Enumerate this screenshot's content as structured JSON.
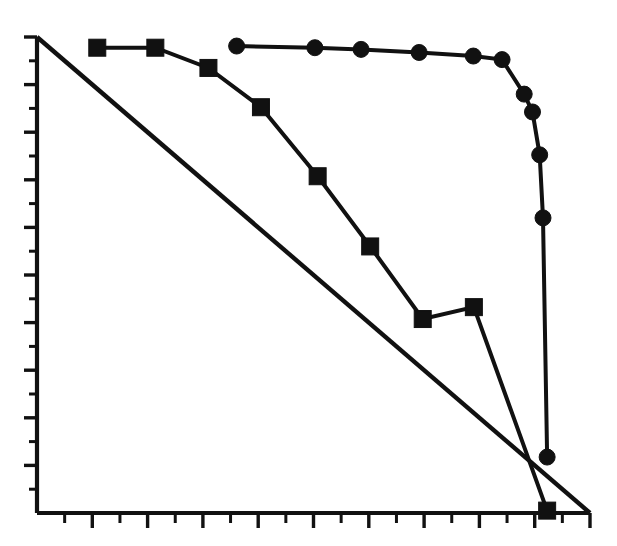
{
  "figure": {
    "width": 617,
    "height": 546,
    "background": "#ffffff",
    "ink_color": "#111111"
  },
  "chart_data": {
    "type": "line",
    "title": "",
    "subtitle": "",
    "xlabel": "",
    "ylabel": "",
    "grid": false,
    "legend_position": "none",
    "legend_entries": [],
    "xlim": [
      0,
      20
    ],
    "ylim": [
      0,
      20
    ],
    "x_tick_labels": [],
    "y_tick_labels": [],
    "x_tick_count": 20,
    "y_tick_count": 20,
    "axis_style": "open-left-bottom",
    "annotations": [],
    "series": [
      {
        "name": "diagonal-reference-line",
        "marker": "none",
        "marker_size": 0,
        "color": "#111111",
        "points": [
          {
            "x": 0.0,
            "y": 20.0
          },
          {
            "x": 20.0,
            "y": 0.0
          }
        ]
      },
      {
        "name": "square-series",
        "marker": "square",
        "marker_size": 17,
        "color": "#111111",
        "points": [
          {
            "x": 2.18,
            "y": 19.55
          },
          {
            "x": 4.28,
            "y": 19.55
          },
          {
            "x": 6.2,
            "y": 18.7
          },
          {
            "x": 8.1,
            "y": 17.05
          },
          {
            "x": 10.15,
            "y": 14.15
          },
          {
            "x": 12.05,
            "y": 11.2
          },
          {
            "x": 13.95,
            "y": 8.15
          },
          {
            "x": 15.8,
            "y": 8.65
          },
          {
            "x": 18.45,
            "y": 0.1
          }
        ]
      },
      {
        "name": "circle-series",
        "marker": "circle",
        "marker_size": 16,
        "color": "#111111",
        "points": [
          {
            "x": 7.22,
            "y": 19.62
          },
          {
            "x": 10.05,
            "y": 19.55
          },
          {
            "x": 11.72,
            "y": 19.48
          },
          {
            "x": 13.82,
            "y": 19.35
          },
          {
            "x": 15.78,
            "y": 19.2
          },
          {
            "x": 16.82,
            "y": 19.05
          },
          {
            "x": 17.62,
            "y": 17.6
          },
          {
            "x": 17.92,
            "y": 16.85
          },
          {
            "x": 18.18,
            "y": 15.05
          },
          {
            "x": 18.3,
            "y": 12.4
          },
          {
            "x": 18.45,
            "y": 2.35
          }
        ]
      }
    ]
  }
}
